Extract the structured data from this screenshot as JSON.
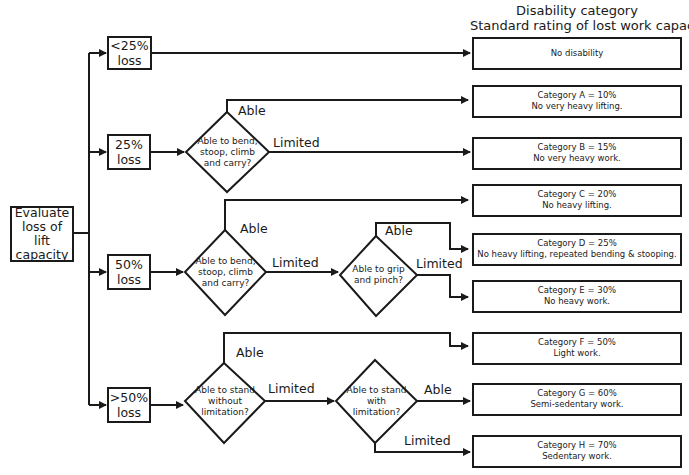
{
  "header": {
    "line1": "Disability category",
    "line2": "Standard rating of lost work capacity"
  },
  "start": {
    "lines": [
      "Evaluate",
      "loss of",
      "lift",
      "capacity"
    ]
  },
  "loss_levels": [
    {
      "line1": "<25%",
      "line2": "loss"
    },
    {
      "line1": "25%",
      "line2": "loss"
    },
    {
      "line1": "50%",
      "line2": "loss"
    },
    {
      "line1": ">50%",
      "line2": "loss"
    }
  ],
  "questions": [
    {
      "lines": [
        "Able to bend,",
        "stoop, climb",
        "and carry?"
      ]
    },
    {
      "lines": [
        "Able to bend,",
        "stoop, climb",
        "and carry?"
      ]
    },
    {
      "lines": [
        "Able to grip",
        "and pinch?"
      ]
    },
    {
      "lines": [
        "Able to stand",
        "without",
        "limitation?"
      ]
    },
    {
      "lines": [
        "Able to stand",
        "with",
        "limitation?"
      ]
    }
  ],
  "branch_labels": {
    "able": "Able",
    "limited": "Limited"
  },
  "outcomes": [
    {
      "line1": "No disability",
      "line2": ""
    },
    {
      "line1": "Category A = 10%",
      "line2": "No very heavy lifting."
    },
    {
      "line1": "Category B = 15%",
      "line2": "No very heavy work."
    },
    {
      "line1": "Category C = 20%",
      "line2": "No heavy lifting."
    },
    {
      "line1": "Category D = 25%",
      "line2": "No heavy lifting, repeated bending & stooping."
    },
    {
      "line1": "Category E = 30%",
      "line2": "No heavy work."
    },
    {
      "line1": "Category F = 50%",
      "line2": "Light work."
    },
    {
      "line1": "Category G = 60%",
      "line2": "Semi-sedentary work."
    },
    {
      "line1": "Category H = 70%",
      "line2": "Sedentary work."
    }
  ]
}
